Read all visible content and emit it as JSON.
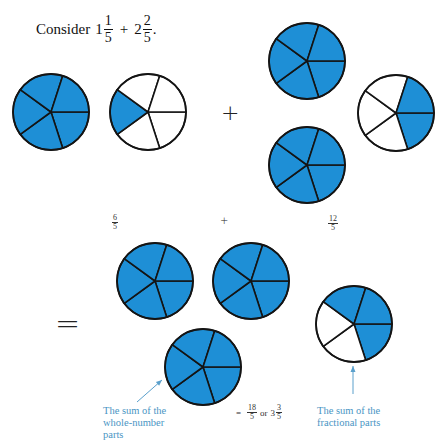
{
  "prompt": {
    "label": "Consider",
    "mixed1": {
      "whole": "1",
      "num": "1",
      "den": "5"
    },
    "operator": "+",
    "mixed2": {
      "whole": "2",
      "num": "2",
      "den": "5"
    },
    "end": "."
  },
  "operators": {
    "plus_top": "+",
    "plus_mid": "+",
    "equals": "="
  },
  "intermediate": {
    "left_fraction": {
      "num": "6",
      "den": "5"
    },
    "right_fraction": {
      "num": "12",
      "den": "5"
    }
  },
  "result": {
    "equals": "=",
    "improper": {
      "num": "18",
      "den": "5"
    },
    "or_label": "or",
    "mixed": {
      "whole": "3",
      "num": "3",
      "den": "5"
    }
  },
  "captions": {
    "whole_parts": [
      "The sum of the",
      "whole-number",
      "parts"
    ],
    "fractional_parts": [
      "The sum of the",
      "fractional parts"
    ]
  },
  "colors": {
    "fill": "#1e8fd6",
    "empty": "#ffffff",
    "stroke": "#141414",
    "caption": "#4a95c4",
    "arrow": "#5aa0cc"
  },
  "fraction_circles": [
    {
      "name": "circle-1-whole",
      "cx": 51,
      "cy": 112,
      "r": 38,
      "slices": 5,
      "shaded": [
        0,
        1,
        2,
        3,
        4
      ]
    },
    {
      "name": "circle-1-fifth",
      "cx": 148,
      "cy": 112,
      "r": 38,
      "slices": 5,
      "shaded": [
        2
      ]
    },
    {
      "name": "circle-2-whole-a",
      "cx": 307,
      "cy": 61,
      "r": 38,
      "slices": 5,
      "shaded": [
        0,
        1,
        2,
        3,
        4
      ]
    },
    {
      "name": "circle-2-two-fifths",
      "cx": 396,
      "cy": 113,
      "r": 38,
      "slices": 5,
      "shaded": [
        0,
        4
      ]
    },
    {
      "name": "circle-2-whole-b",
      "cx": 307,
      "cy": 165,
      "r": 38,
      "slices": 5,
      "shaded": [
        0,
        1,
        2,
        3,
        4
      ]
    },
    {
      "name": "sum-whole-a",
      "cx": 155,
      "cy": 281,
      "r": 38,
      "slices": 5,
      "shaded": [
        0,
        1,
        2,
        3,
        4
      ]
    },
    {
      "name": "sum-whole-b",
      "cx": 251,
      "cy": 281,
      "r": 38,
      "slices": 5,
      "shaded": [
        0,
        1,
        2,
        3,
        4
      ]
    },
    {
      "name": "sum-whole-c",
      "cx": 203,
      "cy": 367,
      "r": 38,
      "slices": 5,
      "shaded": [
        0,
        1,
        2,
        3,
        4
      ]
    },
    {
      "name": "sum-fraction-three-fifths",
      "cx": 354,
      "cy": 324,
      "r": 38,
      "slices": 5,
      "shaded": [
        0,
        3,
        4
      ]
    }
  ],
  "arrows": [
    {
      "name": "whole-parts-arrow",
      "x1": 137,
      "y1": 402,
      "x2": 162,
      "y2": 380
    },
    {
      "name": "fractional-parts-arrow",
      "x1": 353,
      "y1": 394,
      "x2": 353,
      "y2": 366
    }
  ]
}
